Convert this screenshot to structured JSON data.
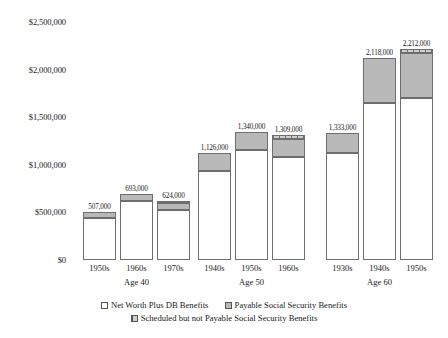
{
  "chart_data": {
    "type": "bar",
    "subtype": "stacked-column-grouped",
    "title": "",
    "xlabel": "",
    "ylabel": "",
    "ylim": [
      0,
      2500000
    ],
    "ytick_step": 500000,
    "grid": false,
    "legend_position": "bottom",
    "ytick_labels": [
      "$2,500,000",
      "$2,000,000",
      "$1,500,000",
      "$1,000,000",
      "$500,000",
      "$0"
    ],
    "ytick_values": [
      2500000,
      2000000,
      1500000,
      1000000,
      500000,
      0
    ],
    "legend": [
      {
        "key": "net_worth",
        "label": "Net Worth Plus DB Benefits",
        "swatch": "white-square"
      },
      {
        "key": "payable",
        "label": "Payable Social Security Benefits",
        "swatch": "gray-square"
      },
      {
        "key": "scheduled",
        "label": "Scheduled but not Payable Social Security Benefits",
        "swatch": "hatched-square"
      }
    ],
    "series": [
      {
        "name": "Net Worth Plus DB Benefits",
        "values": [
          441000,
          620000,
          525000,
          935000,
          1160000,
          1080000,
          1120000,
          1650000,
          1700000
        ]
      },
      {
        "name": "Payable Social Security Benefits",
        "values": [
          66000,
          73000,
          78000,
          191000,
          180000,
          194000,
          213000,
          468000,
          472000
        ]
      },
      {
        "name": "Scheduled but not Payable Social Security Benefits",
        "values": [
          0,
          0,
          21000,
          0,
          0,
          35000,
          0,
          0,
          40000
        ]
      }
    ],
    "groups": [
      {
        "group_label": "Age 40",
        "bars": [
          {
            "category": "1950s",
            "total": 507000,
            "total_label": "507,000",
            "net_worth": 441000,
            "payable": 66000,
            "scheduled": 0
          },
          {
            "category": "1960s",
            "total": 693000,
            "total_label": "693,000",
            "net_worth": 620000,
            "payable": 73000,
            "scheduled": 0
          },
          {
            "category": "1970s",
            "total": 624000,
            "total_label": "624,000",
            "net_worth": 525000,
            "payable": 78000,
            "scheduled": 21000
          }
        ]
      },
      {
        "group_label": "Age 50",
        "bars": [
          {
            "category": "1940s",
            "total": 1126000,
            "total_label": "1,126,000",
            "net_worth": 935000,
            "payable": 191000,
            "scheduled": 0
          },
          {
            "category": "1950s",
            "total": 1340000,
            "total_label": "1,340,000",
            "net_worth": 1160000,
            "payable": 180000,
            "scheduled": 0
          },
          {
            "category": "1960s",
            "total": 1309000,
            "total_label": "1,309,000",
            "net_worth": 1080000,
            "payable": 194000,
            "scheduled": 35000
          }
        ]
      },
      {
        "group_label": "Age 60",
        "bars": [
          {
            "category": "1930s",
            "total": 1333000,
            "total_label": "1,333,000",
            "net_worth": 1120000,
            "payable": 213000,
            "scheduled": 0
          },
          {
            "category": "1940s",
            "total": 2118000,
            "total_label": "2,118,000",
            "net_worth": 1650000,
            "payable": 468000,
            "scheduled": 0
          },
          {
            "category": "1950s",
            "total": 2212000,
            "total_label": "2,212,000",
            "net_worth": 1700000,
            "payable": 472000,
            "scheduled": 40000
          }
        ]
      }
    ],
    "colors": {
      "net_worth": "#ffffff",
      "payable": "#b9b9b9",
      "scheduled": "#cfcfcf",
      "outline": "#6e6e6e",
      "text": "#1a1a1a",
      "background": "#ffffff"
    }
  }
}
